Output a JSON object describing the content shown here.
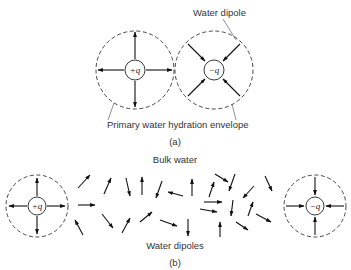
{
  "figure": {
    "panel_a": {
      "caption": "(a)",
      "label_water_dipole": "Water dipole",
      "label_envelope": "Primary water hydration envelope",
      "positive_ion": {
        "label": "+q",
        "cx": 135,
        "cy": 70,
        "r_outer": 39,
        "r_inner": 10
      },
      "negative_ion": {
        "label": "−q",
        "cx": 214,
        "cy": 70,
        "r_outer": 39,
        "r_inner": 10
      }
    },
    "panel_b": {
      "caption": "(b)",
      "label_bulk_water": "Bulk water",
      "label_water_dipoles": "Water dipoles",
      "positive_ion": {
        "label": "+q",
        "cx": 37,
        "cy": 206,
        "r_outer": 31,
        "r_inner": 9
      },
      "negative_ion": {
        "label": "−q",
        "cx": 315,
        "cy": 206,
        "r_outer": 31,
        "r_inner": 9
      }
    },
    "colors": {
      "stroke": "#111111",
      "text": "#333333",
      "background": "#ffffff"
    }
  }
}
